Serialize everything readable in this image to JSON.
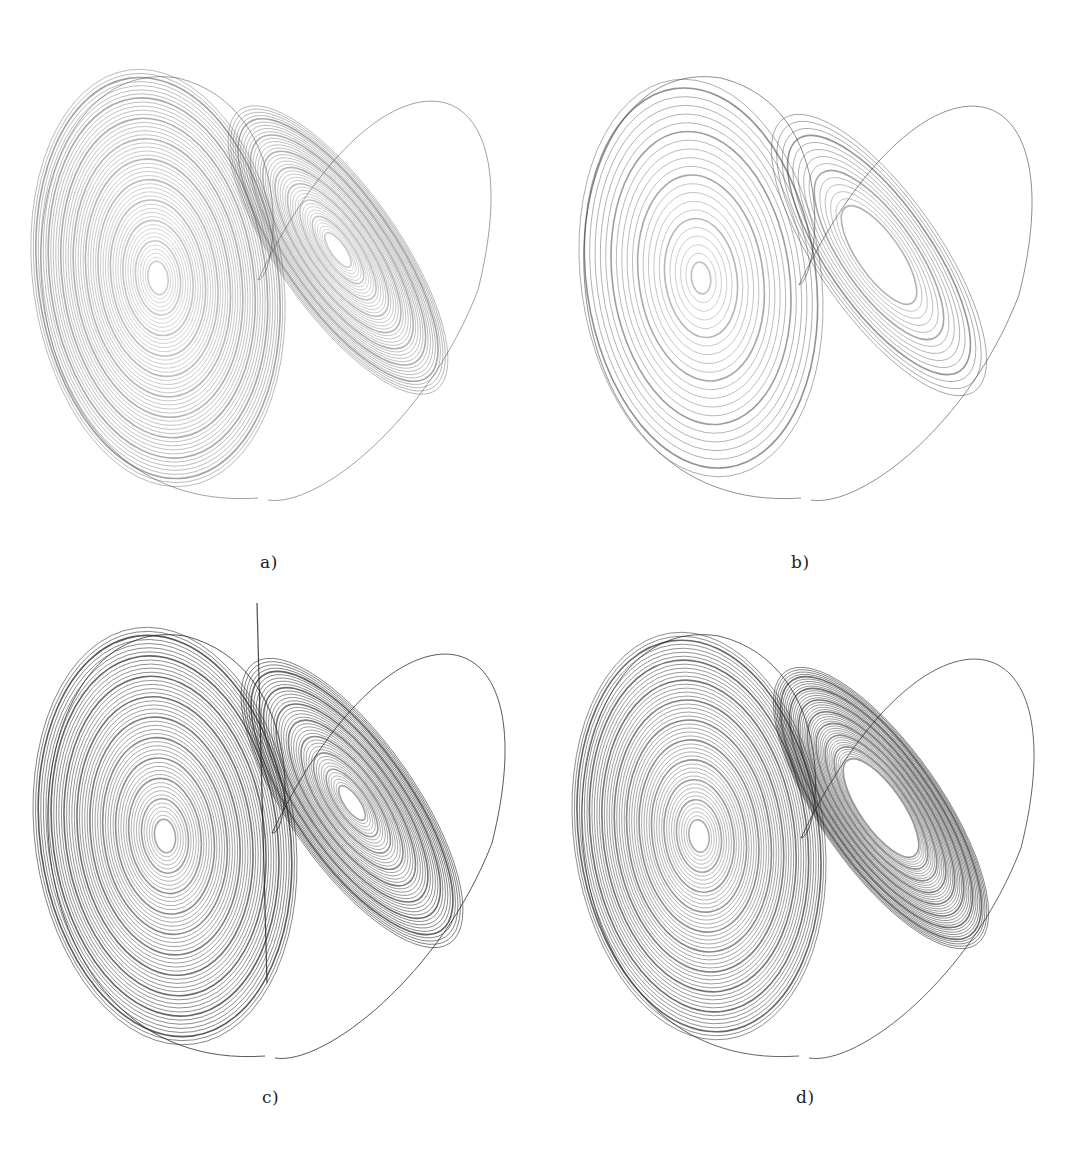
{
  "figure": {
    "panels": [
      {
        "id": "a",
        "label": "a)",
        "style": "light-gray, dense, wide outer orbit",
        "ink": "#555555",
        "opacity": 0.55,
        "vertical_line": false,
        "left_center": [
          158,
          278
        ],
        "right_center": [
          338,
          250
        ],
        "left_rx": 125,
        "left_ry": 210,
        "right_rx": 110,
        "right_ry": 190,
        "tilt_right": -35,
        "caption_pos": [
          260,
          552
        ]
      },
      {
        "id": "b",
        "label": "b)",
        "style": "sparse, few loops",
        "ink": "#444444",
        "opacity": 0.6,
        "vertical_line": false,
        "left_center": [
          162,
          278
        ],
        "right_center": [
          340,
          255
        ],
        "left_rx": 120,
        "left_ry": 200,
        "right_rx": 110,
        "right_ry": 185,
        "tilt_right": -35,
        "caption_pos": [
          252,
          552
        ]
      },
      {
        "id": "c",
        "label": "c)",
        "style": "dark, dense, vertical transient line",
        "ink": "#222222",
        "opacity": 0.75,
        "vertical_line": true,
        "left_center": [
          165,
          253
        ],
        "right_center": [
          352,
          220
        ],
        "left_rx": 130,
        "left_ry": 210,
        "right_rx": 115,
        "right_ry": 190,
        "tilt_right": -35,
        "caption_pos": [
          262,
          504
        ]
      },
      {
        "id": "d",
        "label": "d)",
        "style": "dark, dense, hollow right lobe",
        "ink": "#222222",
        "opacity": 0.7,
        "vertical_line": false,
        "left_center": [
          160,
          253
        ],
        "right_center": [
          342,
          225
        ],
        "left_rx": 125,
        "left_ry": 205,
        "right_rx": 110,
        "right_ry": 185,
        "tilt_right": -35,
        "caption_pos": [
          257,
          504
        ]
      }
    ]
  }
}
